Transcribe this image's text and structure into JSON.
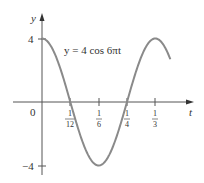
{
  "chart_data": {
    "type": "line",
    "title": "y = 4 cos 6πt",
    "equation_label": "y = 4 cos 6πt",
    "xlabel": "t",
    "ylabel": "y",
    "x_ticks": [
      {
        "value": 0.08333,
        "num": "1",
        "den": "12"
      },
      {
        "value": 0.16667,
        "num": "1",
        "den": "6"
      },
      {
        "value": 0.25,
        "num": "1",
        "den": "4"
      },
      {
        "value": 0.33333,
        "num": "1",
        "den": "3"
      }
    ],
    "y_ticks": [
      {
        "value": 4,
        "label": "4"
      },
      {
        "value": -4,
        "label": "−4"
      }
    ],
    "origin_label": "0",
    "xlim": [
      0,
      0.38
    ],
    "ylim": [
      -4,
      4
    ],
    "function": "4*cos(6*pi*t)",
    "amplitude": 4,
    "angular_frequency": "6π",
    "series": [
      {
        "name": "y = 4 cos 6πt",
        "color": "#8a8a8a",
        "points": [
          [
            0,
            4
          ],
          [
            0.04167,
            2.83
          ],
          [
            0.08333,
            0
          ],
          [
            0.125,
            -2.83
          ],
          [
            0.16667,
            -4
          ],
          [
            0.20833,
            -2.83
          ],
          [
            0.25,
            0
          ],
          [
            0.29167,
            2.83
          ],
          [
            0.33333,
            4
          ],
          [
            0.375,
            2.83
          ]
        ]
      }
    ],
    "grid": false,
    "legend": "none"
  }
}
